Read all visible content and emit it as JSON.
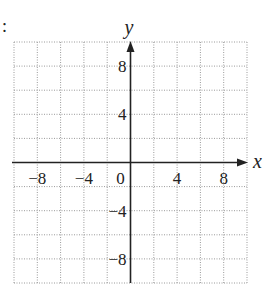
{
  "prefix": ":",
  "chart_data": {
    "type": "coordinate-grid",
    "title": "",
    "xlabel": "x",
    "ylabel": "y",
    "xlim": [
      -10,
      10
    ],
    "ylim": [
      -10,
      10
    ],
    "grid": true,
    "grid_step": 2,
    "grid_style": "dotted",
    "x_tick_labels": [
      {
        "value": -8,
        "label": "−8"
      },
      {
        "value": -4,
        "label": "−4"
      },
      {
        "value": 0,
        "label": "0"
      },
      {
        "value": 4,
        "label": "4"
      },
      {
        "value": 8,
        "label": "8"
      }
    ],
    "y_tick_labels": [
      {
        "value": 8,
        "label": "8"
      },
      {
        "value": 4,
        "label": "4"
      },
      {
        "value": -4,
        "label": "−4"
      },
      {
        "value": -8,
        "label": "−8"
      }
    ],
    "series": []
  },
  "colors": {
    "axis": "#222222",
    "grid": "#9a9a9a"
  }
}
